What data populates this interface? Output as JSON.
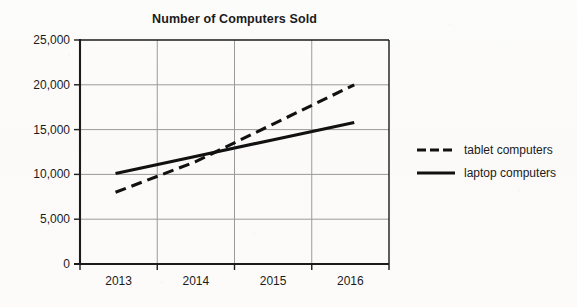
{
  "chart_data": {
    "type": "line",
    "title": "Number of Computers Sold",
    "xlabel": "",
    "ylabel": "",
    "categories": [
      "2013",
      "2014",
      "2015",
      "2016"
    ],
    "series": [
      {
        "name": "tablet computers",
        "style": "dashed",
        "color": "#111111",
        "values": [
          8000,
          11400,
          15700,
          20000
        ]
      },
      {
        "name": "laptop computers",
        "style": "solid",
        "color": "#111111",
        "values": [
          10100,
          12000,
          13900,
          15800
        ]
      }
    ],
    "ylim": [
      0,
      25000
    ],
    "yticks": [
      0,
      5000,
      10000,
      15000,
      20000,
      25000
    ],
    "ytick_labels": [
      "0",
      "5,000",
      "10,000",
      "15,000",
      "20,000",
      "25,000"
    ],
    "xtick_labels": [
      "2013",
      "2014",
      "2015",
      "2016"
    ],
    "grid": true,
    "grid_color": "#9a9a9a",
    "axis_color": "#1b1b1b",
    "legend_position": "right",
    "background_color": "#fdfdfc"
  },
  "legend": {
    "items": [
      {
        "label": "tablet computers",
        "swatch": "dashed-line-icon"
      },
      {
        "label": "laptop computers",
        "swatch": "solid-line-icon"
      }
    ]
  }
}
